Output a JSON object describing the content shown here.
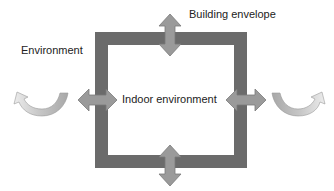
{
  "diagram": {
    "labels": {
      "environment": "Environment",
      "building_envelope": "Building envelope",
      "indoor_environment": "Indoor environment"
    },
    "colors": {
      "envelope_frame": "#6b6b6b",
      "exchange_arrow_fill": "#9a9a9a",
      "exchange_arrow_stroke": "#7a7a7a",
      "curved_arrow_dark": "#a8a8a8",
      "curved_arrow_light": "#e4e4e4",
      "text": "#222222",
      "background": "#ffffff"
    },
    "elements": {
      "envelope_frame": {
        "shape": "square-outline",
        "x": 95,
        "y": 32,
        "width": 152,
        "height": 136,
        "thickness": 13
      },
      "exchange_arrows": [
        {
          "id": "top",
          "direction": "vertical-double",
          "center_x": 170,
          "from_y": 14,
          "to_y": 56
        },
        {
          "id": "bottom",
          "direction": "vertical-double",
          "center_x": 170,
          "from_y": 145,
          "to_y": 186
        },
        {
          "id": "left",
          "direction": "horizontal-double",
          "center_y": 100,
          "from_x": 78,
          "to_x": 117
        },
        {
          "id": "right",
          "direction": "horizontal-double",
          "center_y": 100,
          "from_x": 226,
          "to_x": 266
        }
      ],
      "curved_arrows": [
        {
          "id": "left-outer",
          "icon": "curved-u-turn-arrow",
          "points": "left"
        },
        {
          "id": "right-outer",
          "icon": "curved-u-turn-arrow",
          "points": "right"
        }
      ]
    }
  }
}
